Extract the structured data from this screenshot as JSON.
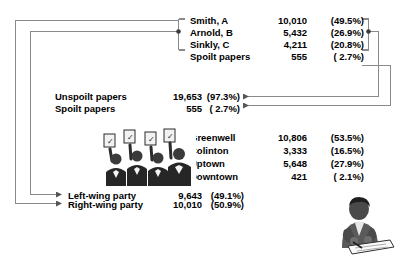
{
  "diagram": {
    "line_color": "#7a7a7a",
    "text_color": "#000000",
    "background": "#ffffff"
  },
  "groups": [
    {
      "id": "candidates",
      "rows": [
        {
          "label": "Smith, A",
          "value": "10,010",
          "percent": "(49.5%)"
        },
        {
          "label": "Arnold, B",
          "value": "5,432",
          "percent": "(26.9%)"
        },
        {
          "label": "Sinkly, C",
          "value": "4,211",
          "percent": "(20.8%)"
        },
        {
          "label": "Spoilt papers",
          "value": "555",
          "percent": "(  2.7%)"
        }
      ]
    },
    {
      "id": "papers",
      "rows": [
        {
          "label": "Unspoilt papers",
          "value": "19,653",
          "percent": "(97.3%)"
        },
        {
          "label": "Spoilt papers",
          "value": "555",
          "percent": "(  2.7%)"
        }
      ]
    },
    {
      "id": "wards",
      "rows": [
        {
          "label": "Greenwell",
          "value": "10,806",
          "percent": "(53.5%)"
        },
        {
          "label": "Colinton",
          "value": "3,333",
          "percent": "(16.5%)"
        },
        {
          "label": "Uptown",
          "value": "5,648",
          "percent": "(27.9%)"
        },
        {
          "label": "Downtown",
          "value": "421",
          "percent": "(  2.1%)"
        }
      ]
    },
    {
      "id": "parties",
      "rows": [
        {
          "label": "Left-wing party",
          "value": "9,643",
          "percent": "(49.1%)"
        },
        {
          "label": "Right-wing party",
          "value": "10,010",
          "percent": "(50.9%)"
        }
      ]
    }
  ],
  "artwork": [
    {
      "id": "voters-clipart",
      "name": "group-of-voters-holding-ballots"
    },
    {
      "id": "official-clipart",
      "name": "official-writing-at-desk"
    }
  ]
}
